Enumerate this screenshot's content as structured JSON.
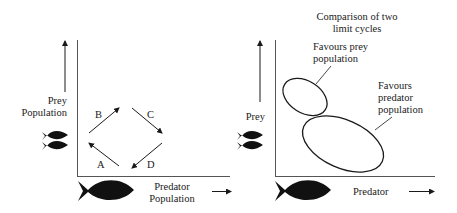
{
  "left_panel": {
    "y_axis_label_line1": "Prey",
    "y_axis_label_line2": "Population",
    "x_axis_label_line1": "Predator",
    "x_axis_label_line2": "Population",
    "cycle_labels": {
      "a": "A",
      "b": "B",
      "c": "C",
      "d": "D"
    }
  },
  "right_panel": {
    "title_line1": "Comparison of two",
    "title_line2": "limit cycles",
    "y_axis_label": "Prey",
    "x_axis_label": "Predator",
    "small_cycle_label_line1": "Favours prey",
    "small_cycle_label_line2": "population",
    "large_cycle_label_line1": "Favours",
    "large_cycle_label_line2": "predator",
    "large_cycle_label_line3": "population"
  },
  "icons": {
    "prey": "prey-fish-pair-icon",
    "predator": "predator-fish-icon"
  },
  "colors": {
    "ink": "#1a1a1a",
    "axis": "#555555",
    "background": "#ffffff"
  }
}
